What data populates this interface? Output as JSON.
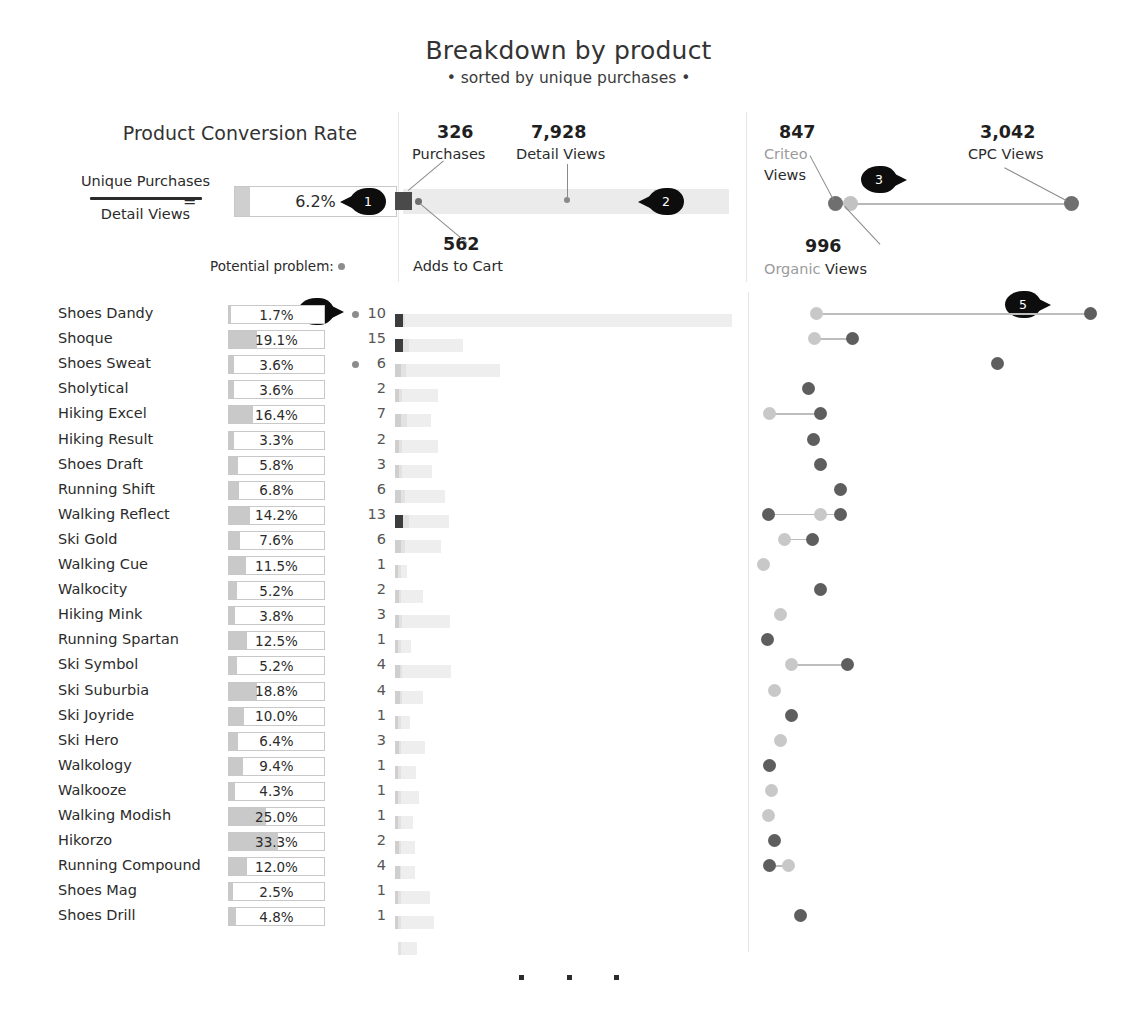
{
  "header": {
    "title": "Breakdown by product",
    "subtitle": "• sorted by unique purchases •"
  },
  "left_panel": {
    "title": "Product Conversion Rate",
    "formula_numerator": "Unique Purchases",
    "formula_denominator": "Detail Views",
    "equals": "=",
    "kpi_value": "6.2%",
    "kpi_fill_pct": 9.4,
    "potential_problem_label": "Potential problem:"
  },
  "middle_panel": {
    "purchases_value": "326",
    "purchases_label": "Purchases",
    "detail_views_value": "7,928",
    "detail_views_label": "Detail Views",
    "adds_to_cart_value": "562",
    "adds_to_cart_label": "Adds to Cart"
  },
  "right_panel": {
    "criteo_value": "847",
    "criteo_label_muted": "Criteo",
    "criteo_label": "Views",
    "organic_value": "996",
    "organic_label_muted": "Organic",
    "organic_label": "Views",
    "cpc_value": "3,042",
    "cpc_label": "CPC Views"
  },
  "callouts": [
    {
      "id": "1",
      "x": 340,
      "y": 188,
      "flip": false
    },
    {
      "id": "2",
      "x": 638,
      "y": 188,
      "flip": false
    },
    {
      "id": "3",
      "x": 861,
      "y": 166,
      "flip": true
    },
    {
      "id": "4",
      "x": 298,
      "y": 298,
      "flip": true
    },
    {
      "id": "5",
      "x": 1005,
      "y": 291,
      "flip": true
    }
  ],
  "colors": {
    "callout": "#0d0d0d",
    "bar_fill": "#c9c9c9",
    "funnel_bar": "#eeeeee",
    "funnel_purchase": "#3c3c3c",
    "funnel_cart": "#e2e2e2",
    "dot_dark": "#5e5e5e",
    "dot_light": "#c8c8c8",
    "divider": "#e6e6e6",
    "muted_text": "#9b9b9b"
  },
  "ellipsis": [
    "•",
    "•",
    "•"
  ],
  "chart_data": {
    "type": "table",
    "title": "Breakdown by product",
    "subtitle": "• sorted by unique purchases •",
    "columns": [
      "Product",
      "Conversion Rate",
      "Potential problem",
      "Unique Purchases",
      "Adds to Cart",
      "Detail Views",
      "Organic Views",
      "Criteo Views",
      "CPC Views"
    ],
    "conversion_rate_scale_max_pct": 66,
    "rows": [
      {
        "product": "Shoes Dandy",
        "rate": "1.7%",
        "rate_num": 1.7,
        "problem": true,
        "purchases": "10",
        "cart_w": 7,
        "bar_w": 331,
        "dots": [
          {
            "x": 58,
            "tone": "light"
          },
          {
            "x": 332,
            "tone": "dark"
          }
        ],
        "connect": [
          58,
          332
        ]
      },
      {
        "product": "Shoque",
        "rate": "19.1%",
        "rate_num": 19.1,
        "problem": false,
        "purchases": "15",
        "cart_w": 11,
        "bar_w": 62,
        "dots": [
          {
            "x": 56,
            "tone": "light"
          },
          {
            "x": 94,
            "tone": "dark"
          }
        ],
        "connect": [
          56,
          94
        ]
      },
      {
        "product": "Shoes Sweat",
        "rate": "3.6%",
        "rate_num": 3.6,
        "problem": true,
        "purchases": "6",
        "cart_w": 8,
        "bar_w": 99,
        "dots": [
          {
            "x": 239,
            "tone": "dark"
          }
        ],
        "connect": null
      },
      {
        "product": "Sholytical",
        "rate": "3.6%",
        "rate_num": 3.6,
        "problem": false,
        "purchases": "2",
        "cart_w": 4,
        "bar_w": 37,
        "dots": [
          {
            "x": 50,
            "tone": "dark"
          }
        ],
        "connect": null
      },
      {
        "product": "Hiking Excel",
        "rate": "16.4%",
        "rate_num": 16.4,
        "problem": false,
        "purchases": "7",
        "cart_w": 9,
        "bar_w": 30,
        "dots": [
          {
            "x": 11,
            "tone": "light"
          },
          {
            "x": 62,
            "tone": "dark"
          }
        ],
        "connect": [
          11,
          62
        ]
      },
      {
        "product": "Hiking Result",
        "rate": "3.3%",
        "rate_num": 3.3,
        "problem": false,
        "purchases": "2",
        "cart_w": 4,
        "bar_w": 37,
        "dots": [
          {
            "x": 55,
            "tone": "dark"
          }
        ],
        "connect": null
      },
      {
        "product": "Shoes Draft",
        "rate": "5.8%",
        "rate_num": 5.8,
        "problem": false,
        "purchases": "3",
        "cart_w": 4,
        "bar_w": 31,
        "dots": [
          {
            "x": 62,
            "tone": "dark"
          }
        ],
        "connect": null
      },
      {
        "product": "Running Shift",
        "rate": "6.8%",
        "rate_num": 6.8,
        "problem": false,
        "purchases": "6",
        "cart_w": 7,
        "bar_w": 44,
        "dots": [
          {
            "x": 82,
            "tone": "dark"
          }
        ],
        "connect": null
      },
      {
        "product": "Walking Reflect",
        "rate": "14.2%",
        "rate_num": 14.2,
        "problem": false,
        "purchases": "13",
        "cart_w": 11,
        "bar_w": 48,
        "dots": [
          {
            "x": 10,
            "tone": "dark"
          },
          {
            "x": 62,
            "tone": "light"
          },
          {
            "x": 82,
            "tone": "dark"
          }
        ],
        "connect": [
          10,
          82
        ]
      },
      {
        "product": "Ski Gold",
        "rate": "7.6%",
        "rate_num": 7.6,
        "problem": false,
        "purchases": "6",
        "cart_w": 7,
        "bar_w": 40,
        "dots": [
          {
            "x": 26,
            "tone": "light"
          },
          {
            "x": 54,
            "tone": "dark"
          }
        ],
        "connect": [
          26,
          54
        ]
      },
      {
        "product": "Walking Cue",
        "rate": "11.5%",
        "rate_num": 11.5,
        "problem": false,
        "purchases": "1",
        "cart_w": 3,
        "bar_w": 6,
        "dots": [
          {
            "x": 5,
            "tone": "light"
          }
        ],
        "connect": null
      },
      {
        "product": "Walkocity",
        "rate": "5.2%",
        "rate_num": 5.2,
        "problem": false,
        "purchases": "2",
        "cart_w": 3,
        "bar_w": 22,
        "dots": [
          {
            "x": 62,
            "tone": "dark"
          }
        ],
        "connect": null
      },
      {
        "product": "Hiking Mink",
        "rate": "3.8%",
        "rate_num": 3.8,
        "problem": false,
        "purchases": "3",
        "cart_w": 4,
        "bar_w": 49,
        "dots": [
          {
            "x": 22,
            "tone": "light"
          }
        ],
        "connect": null
      },
      {
        "product": "Running Spartan",
        "rate": "12.5%",
        "rate_num": 12.5,
        "problem": false,
        "purchases": "1",
        "cart_w": 3,
        "bar_w": 10,
        "dots": [
          {
            "x": 9,
            "tone": "dark"
          }
        ],
        "connect": null
      },
      {
        "product": "Ski Symbol",
        "rate": "5.2%",
        "rate_num": 5.2,
        "problem": false,
        "purchases": "4",
        "cart_w": 4,
        "bar_w": 50,
        "dots": [
          {
            "x": 33,
            "tone": "light"
          },
          {
            "x": 89,
            "tone": "dark"
          }
        ],
        "connect": [
          33,
          89
        ]
      },
      {
        "product": "Ski Suburbia",
        "rate": "18.8%",
        "rate_num": 18.8,
        "problem": false,
        "purchases": "4",
        "cart_w": 4,
        "bar_w": 22,
        "dots": [
          {
            "x": 16,
            "tone": "light"
          }
        ],
        "connect": null
      },
      {
        "product": "Ski Joyride",
        "rate": "10.0%",
        "rate_num": 10.0,
        "problem": false,
        "purchases": "1",
        "cart_w": 3,
        "bar_w": 9,
        "dots": [
          {
            "x": 33,
            "tone": "dark"
          }
        ],
        "connect": null
      },
      {
        "product": "Ski Hero",
        "rate": "6.4%",
        "rate_num": 6.4,
        "problem": false,
        "purchases": "3",
        "cart_w": 3,
        "bar_w": 24,
        "dots": [
          {
            "x": 22,
            "tone": "light"
          }
        ],
        "connect": null
      },
      {
        "product": "Walkology",
        "rate": "9.4%",
        "rate_num": 9.4,
        "problem": false,
        "purchases": "1",
        "cart_w": 3,
        "bar_w": 15,
        "dots": [
          {
            "x": 11,
            "tone": "dark"
          }
        ],
        "connect": null
      },
      {
        "product": "Walkooze",
        "rate": "4.3%",
        "rate_num": 4.3,
        "problem": false,
        "purchases": "1",
        "cart_w": 3,
        "bar_w": 18,
        "dots": [
          {
            "x": 13,
            "tone": "light"
          }
        ],
        "connect": null
      },
      {
        "product": "Walking Modish",
        "rate": "25.0%",
        "rate_num": 25.0,
        "problem": false,
        "purchases": "1",
        "cart_w": 3,
        "bar_w": 12,
        "dots": [
          {
            "x": 10,
            "tone": "light"
          }
        ],
        "connect": null
      },
      {
        "product": "Hikorzo",
        "rate": "33.3%",
        "rate_num": 33.3,
        "problem": false,
        "purchases": "2",
        "cart_w": 3,
        "bar_w": 14,
        "dots": [
          {
            "x": 16,
            "tone": "dark"
          }
        ],
        "connect": null
      },
      {
        "product": "Running Compound",
        "rate": "12.0%",
        "rate_num": 12.0,
        "problem": false,
        "purchases": "4",
        "cart_w": 3,
        "bar_w": 14,
        "dots": [
          {
            "x": 11,
            "tone": "dark"
          },
          {
            "x": 30,
            "tone": "light"
          }
        ],
        "connect": [
          11,
          30
        ]
      },
      {
        "product": "Shoes Mag",
        "rate": "2.5%",
        "rate_num": 2.5,
        "problem": false,
        "purchases": "1",
        "cart_w": 3,
        "bar_w": 29,
        "dots": [],
        "connect": null
      },
      {
        "product": "Shoes Drill",
        "rate": "4.8%",
        "rate_num": 4.8,
        "problem": false,
        "purchases": "1",
        "cart_w": 3,
        "bar_w": 33,
        "dots": [
          {
            "x": 42,
            "tone": "dark"
          }
        ],
        "connect": null
      },
      {
        "product": "",
        "rate": "",
        "rate_num": 0,
        "problem": false,
        "purchases": "",
        "cart_w": 3,
        "bar_w": 16,
        "dots": [],
        "connect": null
      }
    ]
  }
}
